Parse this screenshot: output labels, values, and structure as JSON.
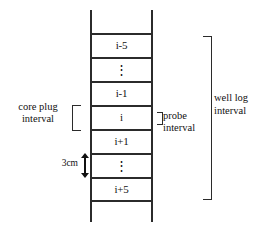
{
  "diagram": {
    "line_color": "#2b2b2b",
    "text_color": "#111111",
    "background": "#ffffff",
    "ladder": {
      "cells": [
        {
          "label": "i-5",
          "kind": "text"
        },
        {
          "label": "⋮",
          "kind": "vdots"
        },
        {
          "label": "i-1",
          "kind": "text"
        },
        {
          "label": "i",
          "kind": "text"
        },
        {
          "label": "i+1",
          "kind": "text"
        },
        {
          "label": "⋮",
          "kind": "vdots"
        },
        {
          "label": "i+5",
          "kind": "text"
        }
      ]
    },
    "annotations": {
      "core_plug": {
        "line1": "core plug",
        "line2": "interval"
      },
      "scale": {
        "label": "3cm"
      },
      "probe": {
        "line1": "probe",
        "line2": "interval"
      },
      "well_log": {
        "line1": "well log",
        "line2": "interval"
      }
    }
  }
}
